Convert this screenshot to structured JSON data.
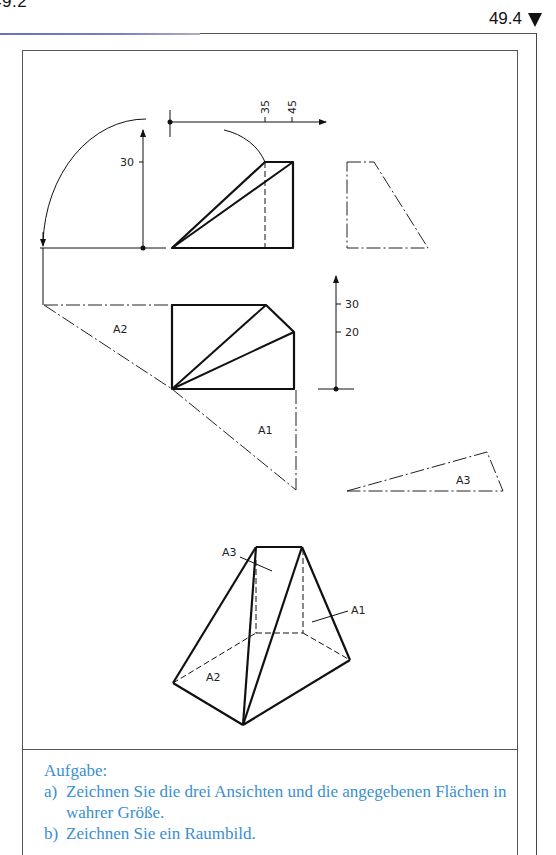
{
  "page": {
    "previous_page_number": "49.2",
    "page_number": "49.4",
    "page_marker_icon": "down-triangle-icon"
  },
  "figure": {
    "front_view": {
      "dimension_labels": [
        "35",
        "45"
      ],
      "height_label": "30"
    },
    "top_view": {
      "dimension_labels": [
        "30",
        "20"
      ]
    },
    "surface_labels": {
      "a1": "A1",
      "a2": "A2",
      "a3": "A3"
    },
    "isometric_labels": {
      "a1": "A1",
      "a2": "A2",
      "a3": "A3"
    }
  },
  "task": {
    "title": "Aufgabe:",
    "items": [
      {
        "marker": "a)",
        "text": "Zeichnen Sie die drei Ansichten und die angegebenen Flächen in wahrer Größe."
      },
      {
        "marker": "b)",
        "text": "Zeichnen Sie ein Raumbild."
      }
    ]
  },
  "colors": {
    "task_text": "#3a8fd0",
    "accent_rule": "#6a6fc0",
    "line": "#111111"
  }
}
